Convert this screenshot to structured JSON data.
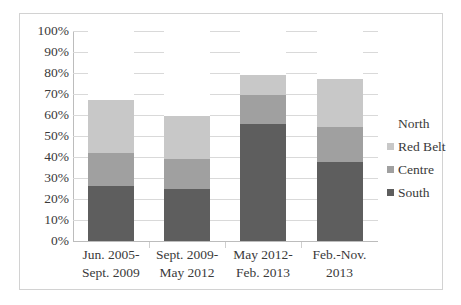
{
  "chart_data": {
    "type": "bar",
    "subtype": "stacked-100-percent",
    "title": "",
    "xlabel": "",
    "ylabel": "",
    "ylim": [
      0,
      100
    ],
    "y_tick_labels": [
      "100%",
      "90%",
      "80%",
      "70%",
      "60%",
      "50%",
      "40%",
      "30%",
      "20%",
      "10%",
      "0%"
    ],
    "y_tick_values": [
      100,
      90,
      80,
      70,
      60,
      50,
      40,
      30,
      20,
      10,
      0
    ],
    "grid": "horizontal",
    "legend_position": "right",
    "categories": [
      "Jun. 2005-Sept. 2009",
      "Sept. 2009-May 2012",
      "May 2012-Feb. 2013",
      "Feb.-Nov. 2013"
    ],
    "category_lines": [
      [
        "Jun. 2005-",
        "Sept. 2009"
      ],
      [
        "Sept. 2009-",
        "May 2012"
      ],
      [
        "May 2012-",
        "Feb. 2013"
      ],
      [
        "Feb.-Nov.",
        "2013"
      ]
    ],
    "series": [
      {
        "name": "South",
        "color": "#5e5e5e",
        "values": [
          26.0,
          25.0,
          55.5,
          37.5
        ]
      },
      {
        "name": "Centre",
        "color": "#a0a0a0",
        "values": [
          16.0,
          14.0,
          14.0,
          17.0
        ]
      },
      {
        "name": "Red Belt",
        "color": "#c8c8c8",
        "values": [
          25.0,
          20.5,
          9.5,
          22.5
        ]
      },
      {
        "name": "North",
        "color": "#ffffff",
        "values": [
          33.0,
          40.5,
          21.0,
          23.0
        ]
      }
    ],
    "cumulative_tops": {
      "South": [
        26.0,
        25.0,
        55.5,
        37.5
      ],
      "Centre": [
        42.0,
        39.0,
        69.5,
        54.5
      ],
      "Red Belt": [
        67.0,
        59.5,
        79.0,
        77.0
      ],
      "North": [
        100.0,
        100.0,
        100.0,
        100.0
      ]
    },
    "legend_entries": [
      {
        "label": "North",
        "color": "#ffffff"
      },
      {
        "label": "Red Belt",
        "color": "#c8c8c8"
      },
      {
        "label": "Centre",
        "color": "#a0a0a0"
      },
      {
        "label": "South",
        "color": "#5e5e5e"
      }
    ]
  }
}
